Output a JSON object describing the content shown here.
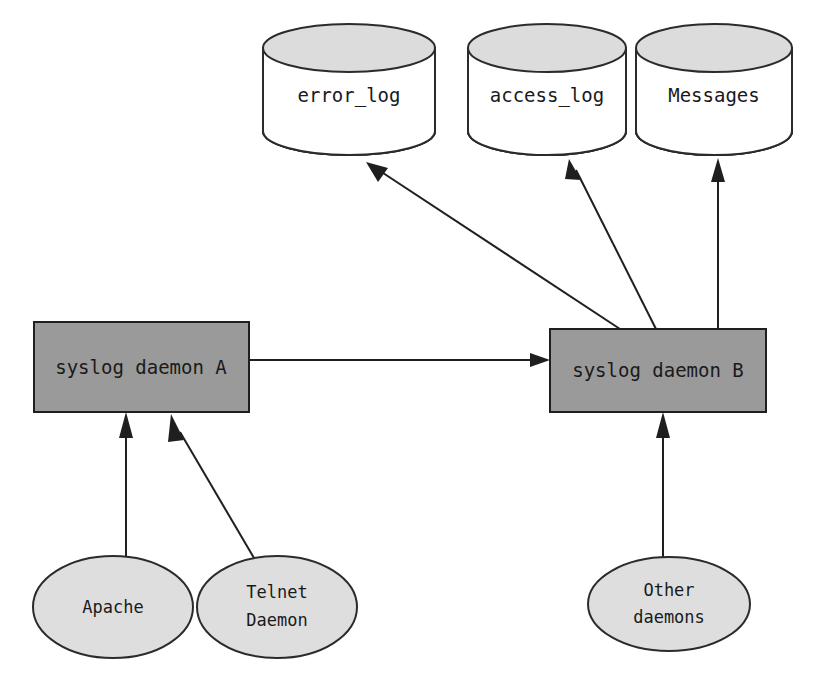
{
  "diagram": {
    "background_color": "#ffffff",
    "colors": {
      "process_fill": "#9a9a9a",
      "store_cap_fill": "#dcdcdc",
      "store_body_fill": "#ffffff",
      "source_fill": "#dedede",
      "stroke": "#1f1f1f",
      "text": "#1a1a1a"
    },
    "log_stores": [
      {
        "id": "error-log",
        "label": "error_log",
        "shape": "cylinder"
      },
      {
        "id": "access-log",
        "label": "access_log",
        "shape": "cylinder"
      },
      {
        "id": "messages",
        "label": "Messages",
        "shape": "cylinder"
      }
    ],
    "daemons": [
      {
        "id": "syslog-daemon-a",
        "label": "syslog daemon A",
        "shape": "rectangle"
      },
      {
        "id": "syslog-daemon-b",
        "label": "syslog daemon B",
        "shape": "rectangle"
      }
    ],
    "sources": [
      {
        "id": "apache",
        "label": "Apache",
        "line1": "Apache",
        "line2": "",
        "shape": "ellipse"
      },
      {
        "id": "telnet-daemon",
        "label": "Telnet Daemon",
        "line1": "Telnet",
        "line2": "Daemon",
        "shape": "ellipse"
      },
      {
        "id": "other-daemons",
        "label": "Other daemons",
        "line1": "Other",
        "line2": "daemons",
        "shape": "ellipse"
      }
    ],
    "edges": [
      {
        "id": "apache-to-a",
        "from": "Apache",
        "to": "syslog daemon A"
      },
      {
        "id": "telnet-to-a",
        "from": "Telnet Daemon",
        "to": "syslog daemon A"
      },
      {
        "id": "a-to-b",
        "from": "syslog daemon A",
        "to": "syslog daemon B"
      },
      {
        "id": "other-to-b",
        "from": "Other daemons",
        "to": "syslog daemon B"
      },
      {
        "id": "b-to-error-log",
        "from": "syslog daemon B",
        "to": "error_log"
      },
      {
        "id": "b-to-access-log",
        "from": "syslog daemon B",
        "to": "access_log"
      },
      {
        "id": "b-to-messages",
        "from": "syslog daemon B",
        "to": "Messages"
      }
    ]
  }
}
